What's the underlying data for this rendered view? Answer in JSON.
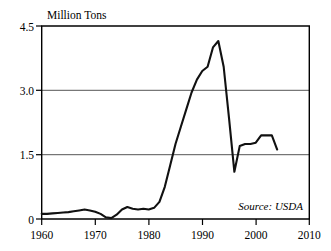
{
  "chart_data": {
    "type": "line",
    "title": "Million Tons",
    "xlabel": "",
    "ylabel": "Million Tons",
    "xlim": [
      1960,
      2010
    ],
    "ylim": [
      0,
      4.5
    ],
    "grid": true,
    "legend": false,
    "annotation": "Source: USDA",
    "yticks": [
      "0",
      "1.5",
      "3.0",
      "4.5"
    ],
    "ytick_values": [
      0,
      1.5,
      3.0,
      4.5
    ],
    "xticks": [
      "1960",
      "1970",
      "1980",
      "1990",
      "2000",
      "2010"
    ],
    "xtick_values": [
      1960,
      1970,
      1980,
      1990,
      2000,
      2010
    ],
    "series": [
      {
        "name": "Production",
        "x": [
          1960,
          1961,
          1962,
          1963,
          1964,
          1965,
          1966,
          1967,
          1968,
          1969,
          1970,
          1971,
          1972,
          1973,
          1974,
          1975,
          1976,
          1977,
          1978,
          1979,
          1980,
          1981,
          1982,
          1983,
          1984,
          1985,
          1986,
          1987,
          1988,
          1989,
          1990,
          1991,
          1992,
          1993,
          1994,
          1995,
          1996,
          1997,
          1998,
          1999,
          2000,
          2001,
          2002,
          2003,
          2004
        ],
        "values": [
          0.12,
          0.12,
          0.13,
          0.14,
          0.15,
          0.16,
          0.18,
          0.2,
          0.22,
          0.2,
          0.17,
          0.12,
          0.04,
          0.02,
          0.1,
          0.22,
          0.28,
          0.24,
          0.22,
          0.24,
          0.22,
          0.26,
          0.4,
          0.75,
          1.25,
          1.75,
          2.15,
          2.55,
          2.95,
          3.25,
          3.45,
          3.55,
          4.0,
          4.15,
          3.55,
          2.35,
          1.1,
          1.7,
          1.75,
          1.75,
          1.78,
          1.95,
          1.95,
          1.95,
          1.62
        ]
      }
    ]
  },
  "axes": {
    "title": "Million Tons",
    "source_note": "Source: USDA"
  }
}
